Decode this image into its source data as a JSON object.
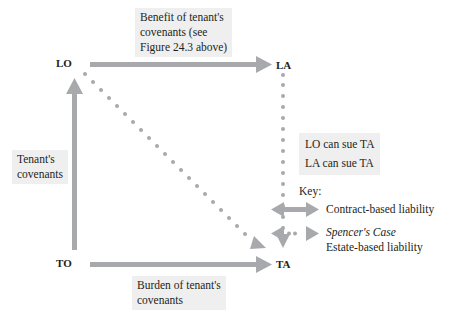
{
  "nodes": {
    "lo": "LO",
    "la": "LA",
    "to": "TO",
    "ta": "TA"
  },
  "labels": {
    "benefit": [
      "Benefit of tenant's",
      "covenants (see",
      "Figure 24.3 above)"
    ],
    "tenant_covenants": [
      "Tenant's",
      "covenants"
    ],
    "burden": [
      "Burden of tenant's",
      "covenants"
    ],
    "can_sue": [
      "LO can sue TA",
      "LA can sue TA"
    ]
  },
  "key": {
    "title": "Key:",
    "items": [
      {
        "style": "solid-double-arrow",
        "lines": [
          "Contract-based liability"
        ]
      },
      {
        "style": "dotted-double-arrow",
        "lines": [
          "Spencer's Case",
          "Estate-based liability"
        ],
        "italic_first_line": true
      }
    ]
  },
  "colors": {
    "arrow": "#a7a9ac",
    "label_bg": "#efefef",
    "text": "#231f20"
  }
}
